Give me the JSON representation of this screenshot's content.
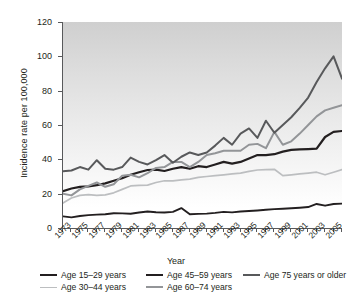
{
  "chart_data": {
    "type": "line",
    "title": "",
    "xlabel": "Year",
    "ylabel": "Incidence rate per 100,000",
    "xlim": [
      1973,
      2006
    ],
    "ylim": [
      0,
      120
    ],
    "grid": false,
    "legend_position": "bottom",
    "y_ticks": [
      0,
      20,
      40,
      60,
      80,
      100,
      120
    ],
    "x_ticks": [
      1973,
      1975,
      1977,
      1979,
      1981,
      1983,
      1985,
      1987,
      1989,
      1991,
      1993,
      1995,
      1997,
      1999,
      2001,
      2003,
      2005
    ],
    "x": [
      1973,
      1974,
      1975,
      1976,
      1977,
      1978,
      1979,
      1980,
      1981,
      1982,
      1983,
      1984,
      1985,
      1986,
      1987,
      1988,
      1989,
      1990,
      1991,
      1992,
      1993,
      1994,
      1995,
      1996,
      1997,
      1998,
      1999,
      2000,
      2001,
      2002,
      2003,
      2004,
      2005,
      2006
    ],
    "series": [
      {
        "name": "Age 15–29 years",
        "color": "#231f20",
        "width": 1.9,
        "values": [
          6.8,
          6.2,
          7.0,
          7.5,
          7.8,
          8.0,
          8.6,
          8.5,
          8.3,
          9.0,
          9.6,
          9.2,
          9.0,
          9.4,
          11.6,
          8.0,
          8.2,
          8.4,
          8.8,
          9.4,
          9.1,
          9.6,
          9.9,
          10.2,
          10.6,
          11.0,
          11.2,
          11.5,
          11.8,
          12.2,
          14.0,
          13.0,
          14.0,
          14.2
        ]
      },
      {
        "name": "Age 30–44 years",
        "color": "#bcbec0",
        "width": 1.7,
        "values": [
          14.5,
          17.5,
          19.0,
          19.5,
          19.0,
          19.3,
          20.5,
          22.5,
          24.5,
          24.8,
          25.0,
          26.5,
          27.5,
          27.5,
          28.0,
          28.5,
          29.5,
          30.0,
          30.5,
          31.0,
          31.5,
          32.0,
          33.0,
          33.8,
          34.0,
          34.2,
          30.5,
          31.0,
          31.5,
          32.0,
          32.5,
          31.0,
          32.5,
          34.0
        ]
      },
      {
        "name": "Age 45–59 years",
        "color": "#231f20",
        "width": 2.2,
        "values": [
          21.5,
          23.0,
          24.0,
          24.2,
          25.0,
          26.0,
          27.5,
          29.0,
          31.0,
          32.5,
          33.8,
          34.0,
          33.2,
          34.5,
          35.5,
          34.5,
          36.0,
          35.5,
          37.0,
          38.5,
          37.5,
          38.5,
          40.5,
          42.5,
          42.5,
          43.0,
          44.5,
          45.5,
          45.8,
          46.0,
          46.2,
          53.0,
          56.0,
          56.5
        ]
      },
      {
        "name": "Age 60–74 years",
        "color": "#939598",
        "width": 2.0,
        "values": [
          20.0,
          19.0,
          22.5,
          24.5,
          26.5,
          24.0,
          25.5,
          30.5,
          31.0,
          29.5,
          32.0,
          35.0,
          35.5,
          38.5,
          38.5,
          35.5,
          38.5,
          42.5,
          43.5,
          45.0,
          45.0,
          45.0,
          48.5,
          49.0,
          46.5,
          56.0,
          48.5,
          50.5,
          55.0,
          60.0,
          65.0,
          68.5,
          70.0,
          71.5
        ]
      },
      {
        "name": "Age 75 years or older",
        "color": "#58595b",
        "width": 2.0,
        "values": [
          33.0,
          33.5,
          35.5,
          34.0,
          39.5,
          34.5,
          34.0,
          35.5,
          41.0,
          38.5,
          37.0,
          39.5,
          42.5,
          38.0,
          41.5,
          44.0,
          42.5,
          44.0,
          48.0,
          52.5,
          48.5,
          55.0,
          58.0,
          52.5,
          62.5,
          55.5,
          60.0,
          64.5,
          70.0,
          76.0,
          85.0,
          93.0,
          100.0,
          87.0
        ]
      }
    ],
    "legend": [
      {
        "name": "Age 15–29 years",
        "color": "#231f20",
        "width": 2.2
      },
      {
        "name": "Age 30–44 years",
        "color": "#bcbec0",
        "width": 1.6
      },
      {
        "name": "Age 45–59 years",
        "color": "#231f20",
        "width": 2.4
      },
      {
        "name": "Age 60–74 years",
        "color": "#939598",
        "width": 2.0
      },
      {
        "name": "Age 75 years or older",
        "color": "#58595b",
        "width": 2.0
      }
    ]
  }
}
